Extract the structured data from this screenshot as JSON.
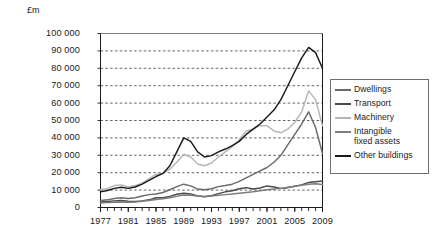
{
  "chart": {
    "type": "line",
    "unit_label": "£m",
    "title": "",
    "xlabel": "",
    "ylabel": "£m"
  },
  "chart_data": {
    "type": "line",
    "title": "",
    "xlabel": "",
    "ylabel": "£m",
    "unit_label": "£m",
    "ylim": [
      0,
      100000
    ],
    "xlim": [
      1977,
      2009
    ],
    "grid": true,
    "grid_style": "dashed-horizontal",
    "legend_position": "right-outside",
    "ytick_labels": [
      "0",
      "10 000",
      "20 000",
      "30 000",
      "40 000",
      "50 000",
      "60 000",
      "70 000",
      "80 000",
      "90 000",
      "100 000"
    ],
    "ytick_values": [
      0,
      10000,
      20000,
      30000,
      40000,
      50000,
      60000,
      70000,
      80000,
      90000,
      100000
    ],
    "xtick_labels": [
      "1977",
      "1981",
      "1985",
      "1989",
      "1993",
      "1997",
      "2001",
      "2005",
      "2009"
    ],
    "xtick_values": [
      1977,
      1981,
      1985,
      1989,
      1993,
      1997,
      2001,
      2005,
      2009
    ],
    "minor_xticks_every_year": true,
    "x": [
      1977,
      1978,
      1979,
      1980,
      1981,
      1982,
      1983,
      1984,
      1985,
      1986,
      1987,
      1988,
      1989,
      1990,
      1991,
      1992,
      1993,
      1994,
      1995,
      1996,
      1997,
      1998,
      1999,
      2000,
      2001,
      2002,
      2003,
      2004,
      2005,
      2006,
      2007,
      2008,
      2009
    ],
    "series": [
      {
        "name": "Dwellings",
        "color": "#6a6a6a",
        "values": [
          4000,
          4400,
          5200,
          5600,
          5200,
          5600,
          6600,
          7400,
          7800,
          8600,
          10200,
          12000,
          13400,
          12400,
          10600,
          10200,
          10800,
          12000,
          12600,
          13400,
          15000,
          17000,
          19000,
          21000,
          23000,
          26000,
          30000,
          36000,
          42000,
          48000,
          55000,
          46000,
          31000
        ]
      },
      {
        "name": "Transport",
        "color": "#4a4a4a",
        "values": [
          3200,
          3400,
          3800,
          4000,
          3600,
          3400,
          3800,
          4400,
          5600,
          5600,
          6400,
          7600,
          8200,
          7800,
          6600,
          6200,
          6800,
          8000,
          9000,
          9600,
          10800,
          11400,
          10600,
          11200,
          12400,
          11800,
          11000,
          11400,
          12200,
          13000,
          14400,
          14800,
          15200
        ]
      },
      {
        "name": "Machinery",
        "color": "#b6b6b6",
        "values": [
          10200,
          11000,
          12600,
          13000,
          11800,
          12600,
          14000,
          16600,
          19000,
          19600,
          22000,
          26000,
          30600,
          29000,
          25000,
          24000,
          25600,
          29000,
          32000,
          35000,
          39000,
          44000,
          45000,
          47000,
          47000,
          44000,
          43000,
          45000,
          49000,
          55000,
          67000,
          62000,
          47000
        ]
      },
      {
        "name": "Intangible fixed assets",
        "color": "#7d7d7d",
        "values": [
          2600,
          2800,
          3000,
          3200,
          3000,
          3200,
          3600,
          4000,
          4600,
          5000,
          5600,
          6400,
          7200,
          7000,
          6600,
          6400,
          6600,
          7000,
          7400,
          7800,
          8200,
          8600,
          9000,
          9600,
          10200,
          10600,
          11000,
          11600,
          12200,
          12800,
          13400,
          13600,
          13200
        ]
      },
      {
        "name": "Other buildings",
        "color": "#1a1a1a",
        "values": [
          9000,
          9800,
          11000,
          11600,
          11000,
          11800,
          13400,
          15600,
          17800,
          19600,
          24000,
          32000,
          40000,
          38000,
          32000,
          29000,
          29800,
          32000,
          33600,
          35600,
          38000,
          42000,
          45000,
          48000,
          52000,
          56000,
          62000,
          70000,
          78000,
          86000,
          92000,
          89000,
          80000
        ]
      }
    ]
  },
  "legend": {
    "items": [
      {
        "label": "Dwellings",
        "label_line2": ""
      },
      {
        "label": "Transport",
        "label_line2": ""
      },
      {
        "label": "Machinery",
        "label_line2": ""
      },
      {
        "label": "Intangible",
        "label_line2": "fixed assets"
      },
      {
        "label": "Other buildings",
        "label_line2": ""
      }
    ]
  }
}
